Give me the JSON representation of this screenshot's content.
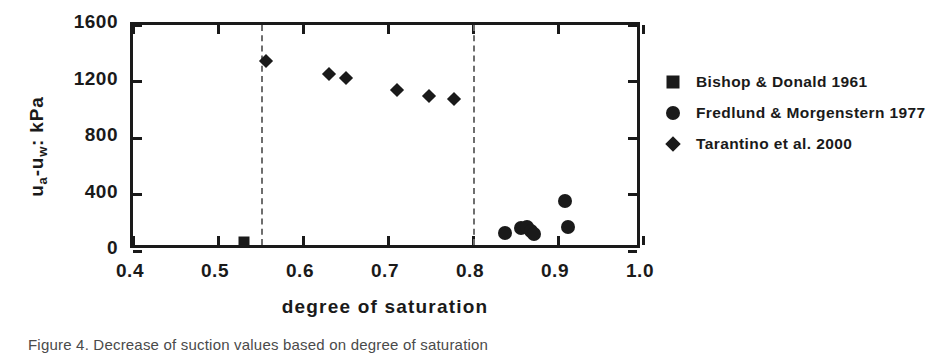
{
  "figure": {
    "caption": "Figure 4. Decrease of suction values based on degree of saturation"
  },
  "chart_data": {
    "type": "scatter",
    "title": "",
    "xlabel": "degree of saturation",
    "ylabel": "u a -u w : kPa",
    "ylabel_parts": {
      "lead": "u",
      "sub1": "a",
      "mid": "-u",
      "sub2": "w",
      "tail": ": kPa"
    },
    "xlim": [
      0.4,
      1.0
    ],
    "ylim": [
      0,
      1600
    ],
    "xticks": [
      0.4,
      0.5,
      0.6,
      0.7,
      0.8,
      0.9,
      1.0
    ],
    "xtick_labels": [
      "0.4",
      "0.5",
      "0.6",
      "0.7",
      "0.8",
      "0.9",
      "1.0"
    ],
    "yticks": [
      0,
      400,
      800,
      1200,
      1600
    ],
    "ytick_labels": [
      "0",
      "400",
      "800",
      "1200",
      "1600"
    ],
    "grid": false,
    "legend_position": "right-outside",
    "reference_lines": [
      {
        "orientation": "vertical",
        "value": 0.55,
        "style": "dashed"
      },
      {
        "orientation": "vertical",
        "value": 0.8,
        "style": "dashed"
      }
    ],
    "series": [
      {
        "name": "Bishop & Donald 1961",
        "marker": "square",
        "color": "#1a1a1a",
        "points": [
          {
            "x": 0.53,
            "y": 62
          }
        ]
      },
      {
        "name": "Fredlund & Morgenstern 1977",
        "marker": "circle",
        "color": "#1a1a1a",
        "points": [
          {
            "x": 0.838,
            "y": 128
          },
          {
            "x": 0.857,
            "y": 160
          },
          {
            "x": 0.863,
            "y": 172
          },
          {
            "x": 0.868,
            "y": 140
          },
          {
            "x": 0.872,
            "y": 118
          },
          {
            "x": 0.908,
            "y": 352
          },
          {
            "x": 0.912,
            "y": 170
          }
        ]
      },
      {
        "name": "Tarantino  et al. 2000",
        "marker": "diamond",
        "color": "#1a1a1a",
        "points": [
          {
            "x": 0.557,
            "y": 1348
          },
          {
            "x": 0.63,
            "y": 1252
          },
          {
            "x": 0.65,
            "y": 1222
          },
          {
            "x": 0.71,
            "y": 1138
          },
          {
            "x": 0.748,
            "y": 1098
          },
          {
            "x": 0.778,
            "y": 1078
          }
        ]
      }
    ]
  }
}
